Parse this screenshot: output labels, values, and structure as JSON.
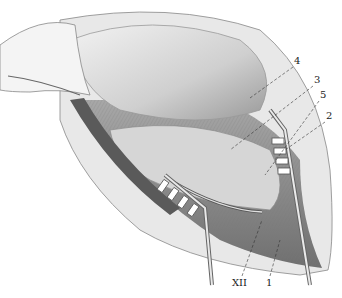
{
  "figure": {
    "type": "anatomical surgical illustration",
    "style": "grayscale engraving",
    "labels": [
      {
        "id": "4",
        "text": "4",
        "x": 296,
        "y": 62
      },
      {
        "id": "3",
        "text": "3",
        "x": 316,
        "y": 81
      },
      {
        "id": "5",
        "text": "5",
        "x": 322,
        "y": 96
      },
      {
        "id": "2",
        "text": "2",
        "x": 328,
        "y": 117
      },
      {
        "id": "XII",
        "text": "XII",
        "x": 236,
        "y": 280
      },
      {
        "id": "1",
        "text": "1",
        "x": 268,
        "y": 280
      }
    ]
  },
  "colors": {
    "background": "#ffffff",
    "ink": "#222222",
    "tissue_light": "#e4e4e4",
    "tissue_mid": "#b5b5b5",
    "tissue_dark": "#5a5a5a"
  }
}
